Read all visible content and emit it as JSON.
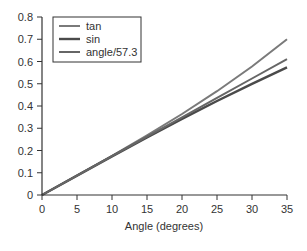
{
  "chart_data": {
    "type": "line",
    "title": "",
    "xlabel": "Angle (degrees)",
    "ylabel": "",
    "xlim": [
      0,
      35
    ],
    "ylim": [
      0,
      0.8
    ],
    "x_ticks": [
      0,
      5,
      10,
      15,
      20,
      25,
      30,
      35
    ],
    "y_ticks": [
      0,
      0.1,
      0.2,
      0.3,
      0.4,
      0.5,
      0.6,
      0.7,
      0.8
    ],
    "y_tick_labels": [
      "0",
      "0.1",
      "0.2",
      "0.3",
      "0.4",
      "0.5",
      "0.6",
      "0.7",
      "0.8"
    ],
    "grid": false,
    "legend_position": "upper left",
    "x": [
      0,
      5,
      10,
      15,
      20,
      25,
      30,
      35
    ],
    "series": [
      {
        "name": "tan",
        "color": "#7a7a7a",
        "width": 2,
        "values": [
          0,
          0.0875,
          0.1763,
          0.2679,
          0.364,
          0.4663,
          0.5774,
          0.7002
        ]
      },
      {
        "name": "sin",
        "color": "#4a4a4a",
        "width": 2.4,
        "values": [
          0,
          0.0872,
          0.1736,
          0.2588,
          0.342,
          0.4226,
          0.5,
          0.5736
        ]
      },
      {
        "name": "angle/57.3",
        "color": "#666666",
        "width": 2,
        "values": [
          0,
          0.0873,
          0.1745,
          0.2618,
          0.349,
          0.4363,
          0.5236,
          0.6108
        ]
      }
    ]
  }
}
